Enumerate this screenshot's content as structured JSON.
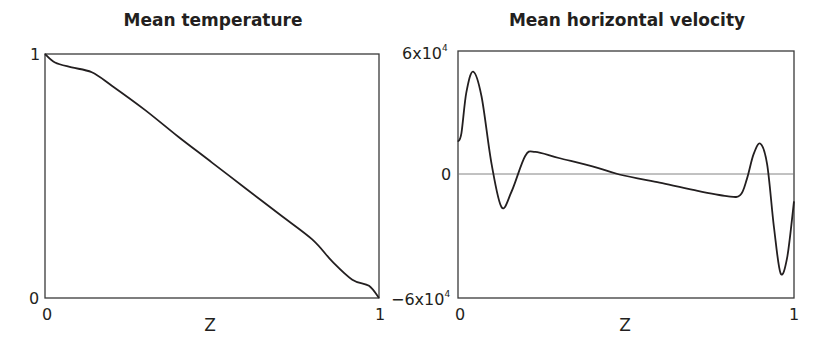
{
  "chart_data": [
    {
      "type": "line",
      "title": "Mean temperature",
      "xlabel": "Z",
      "ylabel": "",
      "xlim": [
        0,
        1
      ],
      "ylim": [
        0,
        1
      ],
      "x_ticks": [
        "0",
        "1"
      ],
      "y_ticks": [
        "0",
        "1"
      ],
      "grid": false,
      "legend": null,
      "series": [
        {
          "name": "Mean temperature",
          "x": [
            0,
            0.03,
            0.08,
            0.14,
            0.2,
            0.3,
            0.4,
            0.5,
            0.6,
            0.7,
            0.8,
            0.86,
            0.92,
            0.97,
            1.0
          ],
          "y": [
            1.0,
            0.965,
            0.945,
            0.925,
            0.87,
            0.77,
            0.66,
            0.555,
            0.45,
            0.345,
            0.24,
            0.15,
            0.075,
            0.05,
            0.0
          ]
        }
      ]
    },
    {
      "type": "line",
      "title": "Mean horizontal velocity",
      "xlabel": "Z",
      "ylabel": "",
      "xlim": [
        0,
        1
      ],
      "ylim": [
        -60000,
        60000
      ],
      "x_ticks": [
        "0",
        "1"
      ],
      "y_ticks": [
        "-6x10^4",
        "0",
        "6x10^4"
      ],
      "grid": false,
      "reference_line": 0,
      "legend": null,
      "series": [
        {
          "name": "Mean horizontal velocity",
          "x": [
            0,
            0.01,
            0.025,
            0.045,
            0.07,
            0.1,
            0.13,
            0.16,
            0.2,
            0.23,
            0.3,
            0.4,
            0.48,
            0.6,
            0.7,
            0.8,
            0.84,
            0.86,
            0.88,
            0.9,
            0.92,
            0.94,
            0.96,
            0.98,
            1.0
          ],
          "y": [
            16000,
            20000,
            40000,
            50000,
            38000,
            5000,
            -16000,
            -8000,
            9000,
            11000,
            8000,
            4000,
            0,
            -4000,
            -7500,
            -10500,
            -10000,
            -2000,
            10000,
            15000,
            5000,
            -25000,
            -48000,
            -40000,
            -13000
          ]
        }
      ]
    }
  ],
  "labels": {
    "left_title": "Mean temperature",
    "right_title": "Mean horizontal velocity",
    "left_ytick_top": "1",
    "left_ytick_bottom": "0",
    "left_xtick_left": "0",
    "left_xtick_right": "1",
    "left_xlabel": "Z",
    "right_ytick_top_mant": "6x10",
    "right_ytick_top_exp": "4",
    "right_ytick_mid": "0",
    "right_ytick_bottom_mant": "−6x10",
    "right_ytick_bottom_exp": "4",
    "right_xtick_left": "0",
    "right_xtick_right": "1",
    "right_xlabel": "Z"
  },
  "colors": {
    "line": "#231f20",
    "axis": "#3a3a3a",
    "zero_line": "#777777"
  }
}
